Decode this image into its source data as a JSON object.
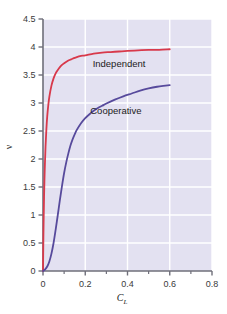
{
  "chart_data": {
    "type": "line",
    "title": "",
    "xlabel": "C_L",
    "xlabel_base": "C",
    "xlabel_sub": "L",
    "ylabel": "ν",
    "xlim": [
      0,
      0.8
    ],
    "ylim": [
      0,
      4.5
    ],
    "xticks": [
      0,
      0.2,
      0.4,
      0.6,
      0.8
    ],
    "xtick_labels": [
      "0",
      "0.2",
      "0.4",
      "0.6",
      "0.8"
    ],
    "xminor_ticks": [
      0.1,
      0.3,
      0.5,
      0.7
    ],
    "yticks": [
      0,
      0.5,
      1,
      1.5,
      2,
      2.5,
      3,
      3.5,
      4,
      4.5
    ],
    "ytick_labels": [
      "0",
      "0.5",
      "1",
      "1.5",
      "2",
      "2.5",
      "3",
      "3.5",
      "4",
      "4.5"
    ],
    "grid": true,
    "grid_color": "#ffffff",
    "plot_background": "#e3e1f1",
    "legend_position": "inline-annotation",
    "series": [
      {
        "name": "Independent",
        "color": "#d8394b",
        "label_x": 0.36,
        "label_y": 3.65,
        "x": [
          0,
          0.002,
          0.005,
          0.008,
          0.012,
          0.016,
          0.02,
          0.025,
          0.03,
          0.04,
          0.05,
          0.06,
          0.07,
          0.08,
          0.09,
          0.1,
          0.12,
          0.14,
          0.16,
          0.18,
          0.2,
          0.24,
          0.28,
          0.32,
          0.36,
          0.4,
          0.45,
          0.5,
          0.55,
          0.6
        ],
        "y": [
          0,
          0.64,
          1.33,
          1.78,
          2.22,
          2.53,
          2.76,
          2.96,
          3.11,
          3.31,
          3.44,
          3.53,
          3.59,
          3.64,
          3.68,
          3.71,
          3.76,
          3.79,
          3.82,
          3.84,
          3.85,
          3.88,
          3.9,
          3.91,
          3.92,
          3.93,
          3.94,
          3.95,
          3.95,
          3.96
        ]
      },
      {
        "name": "Cooperative",
        "color": "#574a9c",
        "label_x": 0.345,
        "label_y": 2.8,
        "x": [
          0,
          0.01,
          0.02,
          0.03,
          0.04,
          0.05,
          0.06,
          0.07,
          0.08,
          0.09,
          0.1,
          0.11,
          0.12,
          0.13,
          0.14,
          0.15,
          0.16,
          0.18,
          0.2,
          0.22,
          0.24,
          0.26,
          0.28,
          0.3,
          0.34,
          0.38,
          0.42,
          0.46,
          0.5,
          0.54,
          0.58,
          0.6
        ],
        "y": [
          0,
          0.03,
          0.08,
          0.17,
          0.31,
          0.5,
          0.74,
          1.0,
          1.27,
          1.52,
          1.75,
          1.94,
          2.1,
          2.24,
          2.35,
          2.44,
          2.52,
          2.64,
          2.73,
          2.8,
          2.86,
          2.91,
          2.95,
          2.99,
          3.06,
          3.12,
          3.17,
          3.22,
          3.26,
          3.29,
          3.31,
          3.32
        ]
      }
    ]
  },
  "axes": {
    "axis_line_color": "#6f6f7a",
    "tick_color": "#6f6f7a"
  }
}
